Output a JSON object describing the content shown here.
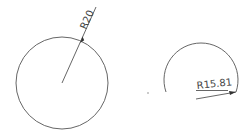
{
  "drawing": {
    "circle": {
      "label": "R20",
      "radius_value": 20
    },
    "arc": {
      "label": "R15.81",
      "radius_value": 15.81
    },
    "colors": {
      "geometry": "#555555",
      "text": "#444444",
      "background": "#ffffff"
    }
  }
}
